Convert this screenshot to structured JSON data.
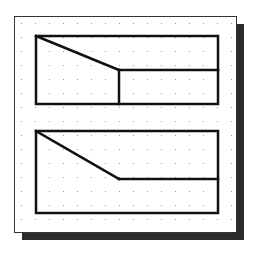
{
  "diagram": {
    "colors": {
      "background": "#ffffff",
      "frame": "#333333",
      "shadow": "#2b2b2b",
      "grid_dot": "#9a9a9a",
      "line": "#111111"
    },
    "sheet": {
      "x": 14,
      "y": 16,
      "width": 222,
      "height": 216,
      "shadow_offset": 8
    },
    "grid": {
      "x0": 21,
      "y0": 23,
      "spacing": 14
    },
    "views": [
      {
        "name": "top-view",
        "rect": {
          "x": 36,
          "y": 36,
          "width": 182,
          "height": 68
        },
        "lines": [
          {
            "x1": 36,
            "y1": 36,
            "x2": 119,
            "y2": 70
          },
          {
            "x1": 119,
            "y1": 70,
            "x2": 218,
            "y2": 70
          },
          {
            "x1": 119,
            "y1": 70,
            "x2": 119,
            "y2": 104
          }
        ]
      },
      {
        "name": "bottom-view",
        "rect": {
          "x": 36,
          "y": 131,
          "width": 182,
          "height": 82
        },
        "lines": [
          {
            "x1": 36,
            "y1": 131,
            "x2": 119,
            "y2": 179
          },
          {
            "x1": 119,
            "y1": 179,
            "x2": 218,
            "y2": 179
          }
        ]
      }
    ]
  }
}
